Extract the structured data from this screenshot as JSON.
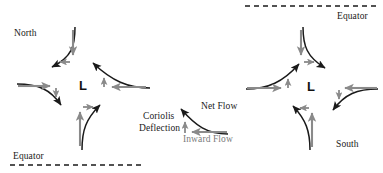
{
  "figure": {
    "colors": {
      "net_flow": "#1a1a1a",
      "inward_flow": "#8a8a8a",
      "deflection": "#8a8a8a",
      "background": "#ffffff",
      "text": "#1a1a1a",
      "text_gray": "#7a7a7a",
      "equator_line": "#1a1a1a"
    }
  },
  "left_panel": {
    "hemisphere": "northern",
    "pole_label": "North",
    "equator_label": "Equator",
    "center_label": "L",
    "center_meaning": "low pressure",
    "rotation": "counterclockwise"
  },
  "right_panel": {
    "hemisphere": "southern",
    "pole_label": "South",
    "equator_label": "Equator",
    "center_label": "L",
    "center_meaning": "low pressure",
    "rotation": "clockwise"
  },
  "legend": {
    "net_flow_label": "Net Flow",
    "coriolis_label_line1": "Coriolis",
    "coriolis_label_line2": "Deflection",
    "inward_flow_label": "Inward Flow"
  }
}
